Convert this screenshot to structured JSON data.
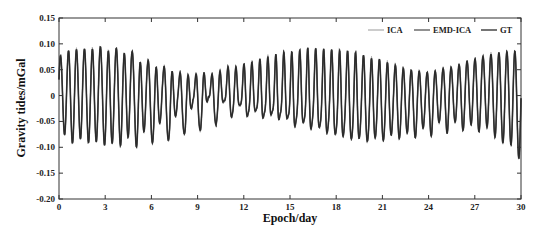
{
  "chart_data": {
    "type": "line",
    "title": "",
    "xlabel": "Epoch/day",
    "ylabel": "Gravity tides/mGal",
    "xlim": [
      0,
      30
    ],
    "ylim": [
      -0.2,
      0.15
    ],
    "xticks": [
      "0",
      "3",
      "6",
      "9",
      "12",
      "15",
      "18",
      "21",
      "24",
      "27",
      "30"
    ],
    "yticks": [
      "0.15",
      "0.10",
      "0.05",
      "0",
      "-0.05",
      "-0.10",
      "-0.15",
      "-0.20"
    ],
    "grid": false,
    "legend_position": "top-right",
    "legend": [
      "ICA",
      "EMD-ICA",
      "GT"
    ],
    "series": [
      {
        "name": "ICA",
        "color": "#b0b0b0",
        "width": 1.0
      },
      {
        "name": "EMD-ICA",
        "color": "#555555",
        "width": 1.6
      },
      {
        "name": "GT",
        "color": "#2a2a2a",
        "width": 1.2
      }
    ],
    "approx_peaks": {
      "x": [
        0.2,
        0.7,
        1.2,
        1.7,
        2.2,
        2.7,
        3.2,
        3.7,
        4.2,
        4.7,
        5.2,
        5.7,
        6.2,
        6.7,
        7.2,
        7.7,
        8.2,
        8.7,
        9.2,
        9.7,
        10.2,
        10.7,
        11.2,
        11.7,
        12.2,
        12.7,
        13.2,
        13.7,
        14.2,
        14.7,
        15.2,
        15.7,
        16.2,
        16.7,
        17.2,
        17.7,
        18.2,
        18.7,
        19.2,
        19.7,
        20.2,
        20.7,
        21.2,
        21.7,
        22.2,
        22.7,
        23.2,
        23.7,
        24.2,
        24.7,
        25.2,
        25.7,
        26.2,
        26.7,
        27.2,
        27.7,
        28.2,
        28.7,
        29.2,
        29.7
      ],
      "max": [
        0.09,
        0.105,
        0.105,
        0.105,
        0.108,
        0.108,
        0.105,
        0.105,
        0.1,
        0.1,
        0.08,
        0.08,
        0.065,
        0.065,
        0.055,
        0.05,
        0.045,
        0.04,
        0.05,
        0.04,
        0.045,
        0.05,
        0.06,
        0.05,
        0.065,
        0.06,
        0.07,
        0.07,
        0.075,
        0.08,
        0.08,
        0.085,
        0.09,
        0.09,
        0.09,
        0.09,
        0.09,
        0.09,
        0.09,
        0.085,
        0.08,
        0.08,
        0.075,
        0.07,
        0.065,
        0.06,
        0.06,
        0.055,
        0.055,
        0.06,
        0.065,
        0.065,
        0.075,
        0.08,
        0.085,
        0.09,
        0.095,
        0.1,
        0.1,
        0.105
      ],
      "min": [
        -0.08,
        -0.11,
        -0.105,
        -0.09,
        -0.13,
        -0.075,
        -0.15,
        -0.07,
        -0.145,
        -0.06,
        -0.145,
        -0.05,
        -0.13,
        -0.04,
        -0.12,
        -0.03,
        -0.1,
        -0.02,
        -0.09,
        -0.01,
        -0.075,
        -0.02,
        -0.06,
        -0.03,
        -0.06,
        -0.045,
        -0.065,
        -0.055,
        -0.07,
        -0.06,
        -0.09,
        -0.065,
        -0.1,
        -0.07,
        -0.11,
        -0.08,
        -0.12,
        -0.085,
        -0.125,
        -0.09,
        -0.12,
        -0.09,
        -0.11,
        -0.085,
        -0.1,
        -0.08,
        -0.095,
        -0.07,
        -0.09,
        -0.06,
        -0.085,
        -0.06,
        -0.08,
        -0.065,
        -0.085,
        -0.07,
        -0.09,
        -0.11,
        -0.1,
        -0.14
      ]
    }
  }
}
